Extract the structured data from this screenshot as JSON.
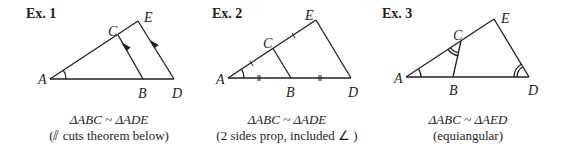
{
  "examples": [
    {
      "title": "Ex. 1",
      "similarity": "ΔABC ~ ΔADE",
      "reason": "(⫽ cuts theorem below)",
      "points": {
        "A": "A",
        "B": "B",
        "C": "C",
        "D": "D",
        "E": "E"
      }
    },
    {
      "title": "Ex. 2",
      "similarity": "ΔABC ~ ΔADE",
      "reason": "(2 sides prop, included ∠ )",
      "points": {
        "A": "A",
        "B": "B",
        "C": "C",
        "D": "D",
        "E": "E"
      }
    },
    {
      "title": "Ex. 3",
      "similarity": "ΔABC ~ ΔAED",
      "reason": "(equiangular)",
      "points": {
        "A": "A",
        "B": "B",
        "C": "C",
        "D": "D",
        "E": "E"
      }
    }
  ],
  "colors": {
    "ink": "#231f20",
    "background": "#ffffff"
  }
}
